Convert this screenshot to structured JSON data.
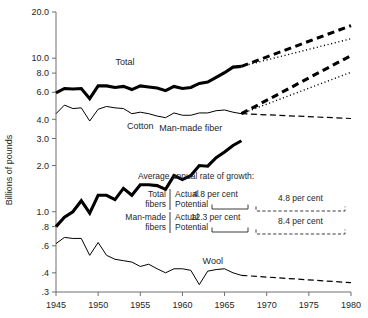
{
  "chart_data": {
    "type": "line",
    "title": "",
    "xlabel": "",
    "ylabel": "Billions of pounds",
    "log_scale": true,
    "grid": false,
    "legend_position": "inline-labels",
    "xlim": [
      1945,
      1980
    ],
    "ylim": [
      0.3,
      20.0
    ],
    "x_ticks": [
      1945,
      1950,
      1955,
      1960,
      1965,
      1970,
      1975,
      1980
    ],
    "x_tick_labels": [
      "1945",
      "1950",
      "1955",
      "1960",
      "1965",
      "1970",
      "1975",
      "1980"
    ],
    "y_ticks": [
      0.3,
      0.4,
      0.6,
      0.8,
      1.0,
      2.0,
      3.0,
      4.0,
      6.0,
      8.0,
      10.0,
      20.0
    ],
    "y_tick_labels": [
      ".3",
      ".4",
      ".6",
      ".8",
      "1.0",
      "2.0",
      "3.0",
      "4.0",
      "6.0",
      "8.0",
      "10.0",
      "20.0"
    ],
    "series": [
      {
        "name": "Total",
        "style": "thick-solid",
        "x": [
          1945,
          1946,
          1947,
          1948,
          1949,
          1950,
          1951,
          1952,
          1953,
          1954,
          1955,
          1956,
          1957,
          1958,
          1959,
          1960,
          1961,
          1962,
          1963,
          1964,
          1965,
          1966,
          1967
        ],
        "values": [
          5.95,
          6.35,
          6.3,
          6.35,
          5.45,
          6.6,
          6.6,
          6.45,
          6.55,
          6.25,
          6.6,
          6.5,
          6.4,
          6.15,
          6.55,
          6.35,
          6.45,
          6.85,
          7.0,
          7.5,
          8.05,
          8.75,
          8.85
        ]
      },
      {
        "name": "Cotton",
        "style": "thin-solid",
        "x": [
          1945,
          1946,
          1947,
          1948,
          1949,
          1950,
          1951,
          1952,
          1953,
          1954,
          1955,
          1956,
          1957,
          1958,
          1959,
          1960,
          1961,
          1962,
          1963,
          1964,
          1965,
          1966,
          1967
        ],
        "values": [
          4.35,
          4.95,
          4.7,
          4.75,
          3.9,
          4.65,
          4.85,
          4.75,
          4.7,
          4.35,
          4.45,
          4.35,
          4.2,
          4.1,
          4.4,
          4.25,
          4.25,
          4.4,
          4.4,
          4.55,
          4.6,
          4.45,
          4.35
        ]
      },
      {
        "name": "Man-made fiber",
        "style": "thick-solid",
        "x": [
          1945,
          1946,
          1947,
          1948,
          1949,
          1950,
          1951,
          1952,
          1953,
          1954,
          1955,
          1956,
          1957,
          1958,
          1959,
          1960,
          1961,
          1962,
          1963,
          1964,
          1965,
          1966,
          1967
        ],
        "values": [
          0.8,
          0.92,
          1.0,
          1.18,
          0.98,
          1.28,
          1.28,
          1.2,
          1.42,
          1.28,
          1.5,
          1.5,
          1.48,
          1.4,
          1.72,
          1.62,
          1.72,
          2.0,
          1.98,
          2.25,
          2.45,
          2.7,
          2.9
        ]
      },
      {
        "name": "Wool",
        "style": "thin-solid",
        "x": [
          1945,
          1946,
          1947,
          1948,
          1949,
          1950,
          1951,
          1952,
          1953,
          1954,
          1955,
          1956,
          1957,
          1958,
          1959,
          1960,
          1961,
          1962,
          1963,
          1964,
          1965,
          1966,
          1967
        ],
        "values": [
          0.62,
          0.68,
          0.67,
          0.67,
          0.52,
          0.63,
          0.52,
          0.49,
          0.48,
          0.47,
          0.44,
          0.455,
          0.425,
          0.4,
          0.425,
          0.425,
          0.415,
          0.335,
          0.41,
          0.42,
          0.425,
          0.4,
          0.385
        ]
      },
      {
        "name": "Total potential projection",
        "style": "thick-dashed",
        "x": [
          1967,
          1980
        ],
        "values": [
          8.85,
          16.3
        ]
      },
      {
        "name": "Total actual projection",
        "style": "dotted",
        "x": [
          1967,
          1980
        ],
        "values": [
          8.85,
          13.4
        ]
      },
      {
        "name": "Man-made potential projection",
        "style": "thick-dashed",
        "x": [
          1967,
          1980
        ],
        "values": [
          4.35,
          10.4
        ]
      },
      {
        "name": "Man-made actual projection",
        "style": "dotted",
        "x": [
          1967,
          1980
        ],
        "values": [
          4.35,
          8.1
        ]
      },
      {
        "name": "Cotton projection",
        "style": "thin-dashed",
        "x": [
          1967,
          1980
        ],
        "values": [
          4.35,
          4.05
        ]
      },
      {
        "name": "Wool projection",
        "style": "thin-dashed",
        "x": [
          1967,
          1980
        ],
        "values": [
          0.385,
          0.345
        ]
      }
    ],
    "annotations": {
      "heading": "Average annual rate of growth:",
      "rows": [
        {
          "group": [
            "Total",
            "fibers"
          ],
          "kind_actual": "Actual",
          "kind_potential": "Potential",
          "actual_value": "4.8 per cent",
          "potential_value": "4.8 per cent"
        },
        {
          "group": [
            "Man-made",
            "fibers"
          ],
          "kind_actual": "Actual",
          "kind_potential": "Potential",
          "actual_value": "12.3 per cent",
          "potential_value": "8.4 per cent"
        }
      ]
    },
    "series_inline_labels": [
      {
        "text": "Total",
        "x": 1953.2,
        "y": 9.1
      },
      {
        "text": "Cotton",
        "x": 1955.0,
        "y": 3.45
      },
      {
        "text": "Man-made fiber",
        "x": 1961.0,
        "y": 3.35
      },
      {
        "text": "Wool",
        "x": 1963.6,
        "y": 0.455
      }
    ],
    "colors": {
      "line": "#000000",
      "axis": "#6e6e6e",
      "text": "#262626",
      "background": "#ffffff"
    }
  }
}
